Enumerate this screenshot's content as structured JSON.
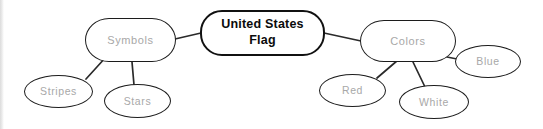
{
  "diagram": {
    "type": "mind-map",
    "title": "United States Flag",
    "background_color": "#ffffff",
    "node_border_color": "#1c1c1c",
    "leaf_text_color": "#a8a8a8",
    "root_text_color": "#0b0b0b",
    "edge_color": "#2a2a2a",
    "nodes": {
      "root": {
        "label": "United States Flag",
        "line1": "United States",
        "line2": "Flag"
      },
      "symbols": {
        "label": "Symbols"
      },
      "colors": {
        "label": "Colors"
      },
      "stripes": {
        "label": "Stripes"
      },
      "stars": {
        "label": "Stars"
      },
      "red": {
        "label": "Red"
      },
      "white": {
        "label": "White"
      },
      "blue": {
        "label": "Blue"
      }
    },
    "edges": [
      {
        "from": "symbols",
        "to": "root"
      },
      {
        "from": "root",
        "to": "colors"
      },
      {
        "from": "stripes",
        "to": "symbols"
      },
      {
        "from": "stars",
        "to": "symbols"
      },
      {
        "from": "red",
        "to": "colors"
      },
      {
        "from": "white",
        "to": "colors"
      },
      {
        "from": "blue",
        "to": "colors"
      }
    ]
  }
}
